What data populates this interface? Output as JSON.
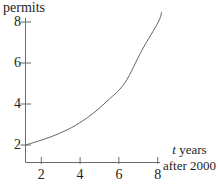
{
  "figure": {
    "ylabel": "permits",
    "xlabel_var": "t",
    "xlabel_rest": "years",
    "xlabel_line2": "after 2000"
  },
  "colors": {
    "background": "#ffffff",
    "axis": "#6b6b6b",
    "curve": "#636363",
    "text": "#1e1e1e"
  },
  "chart_data": {
    "type": "line",
    "title": "",
    "ylabel": "permits",
    "xlabel": "t years after 2000",
    "x_ticks": [
      2,
      4,
      6,
      8
    ],
    "y_ticks": [
      2,
      4,
      6,
      8
    ],
    "xlim": [
      0,
      8.3
    ],
    "ylim": [
      1,
      8.6
    ],
    "grid": false,
    "legend": false,
    "series": [
      {
        "name": "permits",
        "points": [
          [
            0,
            2.0
          ],
          [
            1,
            2.25
          ],
          [
            2,
            2.55
          ],
          [
            3,
            2.95
          ],
          [
            4,
            3.5
          ],
          [
            5,
            4.2
          ],
          [
            6,
            5.05
          ],
          [
            7,
            6.6
          ],
          [
            8,
            8.0
          ],
          [
            8.2,
            8.5
          ]
        ]
      }
    ]
  }
}
